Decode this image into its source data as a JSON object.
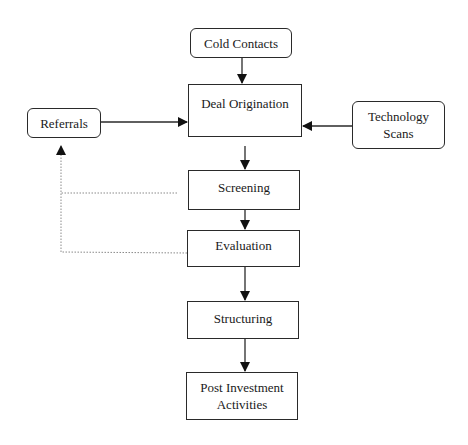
{
  "diagram": {
    "type": "flowchart",
    "nodes": {
      "cold_contacts": {
        "label": "Cold Contacts",
        "shape": "rounded"
      },
      "referrals": {
        "label": "Referrals",
        "shape": "rounded"
      },
      "technology_scans": {
        "label": "Technology\nScans",
        "shape": "rounded"
      },
      "deal_origination": {
        "label": "Deal Origination",
        "shape": "rect"
      },
      "screening": {
        "label": "Screening",
        "shape": "rect"
      },
      "evaluation": {
        "label": "Evaluation",
        "shape": "rect"
      },
      "structuring": {
        "label": "Structuring",
        "shape": "rect"
      },
      "post_investment": {
        "label": "Post Investment\nActivities",
        "shape": "rect"
      }
    },
    "edges": [
      {
        "from": "Cold Contacts",
        "to": "Deal Origination",
        "style": "solid"
      },
      {
        "from": "Referrals",
        "to": "Deal Origination",
        "style": "solid"
      },
      {
        "from": "Technology Scans",
        "to": "Deal Origination",
        "style": "solid"
      },
      {
        "from": "Deal Origination",
        "to": "Screening",
        "style": "solid"
      },
      {
        "from": "Screening",
        "to": "Evaluation",
        "style": "solid"
      },
      {
        "from": "Evaluation",
        "to": "Structuring",
        "style": "solid"
      },
      {
        "from": "Structuring",
        "to": "Post Investment Activities",
        "style": "solid"
      },
      {
        "from": "Screening",
        "to": "Referrals",
        "style": "dotted"
      },
      {
        "from": "Evaluation",
        "to": "Referrals",
        "style": "dotted"
      }
    ],
    "colors": {
      "stroke": "#2a2a2a",
      "dotted": "#8a8a8a",
      "background": "#ffffff"
    }
  }
}
